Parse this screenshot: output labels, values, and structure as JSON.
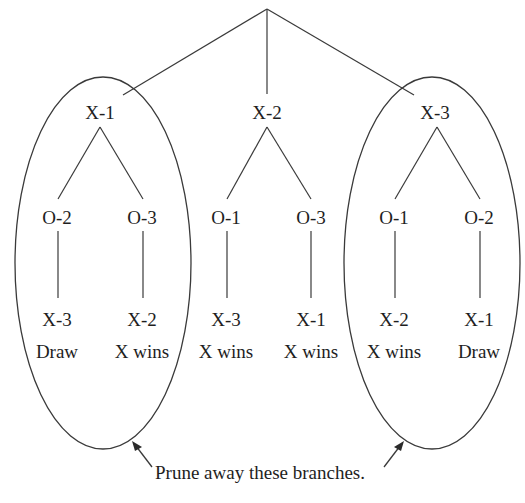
{
  "diagram": {
    "type": "game-tree",
    "root": {
      "label": ""
    },
    "level1": [
      {
        "label": "X-1",
        "pruned": true
      },
      {
        "label": "X-2",
        "pruned": false
      },
      {
        "label": "X-3",
        "pruned": true
      }
    ],
    "level2": [
      {
        "parent": "X-1",
        "label": "O-2"
      },
      {
        "parent": "X-1",
        "label": "O-3"
      },
      {
        "parent": "X-2",
        "label": "O-1"
      },
      {
        "parent": "X-2",
        "label": "O-3"
      },
      {
        "parent": "X-3",
        "label": "O-1"
      },
      {
        "parent": "X-3",
        "label": "O-2"
      }
    ],
    "leaves": [
      {
        "label": "X-3",
        "outcome": "Draw"
      },
      {
        "label": "X-2",
        "outcome": "X wins"
      },
      {
        "label": "X-3",
        "outcome": "X wins"
      },
      {
        "label": "X-1",
        "outcome": "X wins"
      },
      {
        "label": "X-2",
        "outcome": "X wins"
      },
      {
        "label": "X-1",
        "outcome": "Draw"
      }
    ],
    "caption": "Prune away these branches."
  }
}
